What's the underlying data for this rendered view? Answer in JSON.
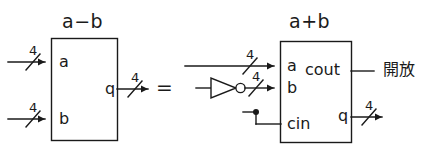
{
  "diagram": {
    "type": "digital-logic-circuit-equivalence",
    "background_color": "#ffffff",
    "ink_color": "#1a1a1a",
    "equality_symbol": "=",
    "left_circuit": {
      "title": "a−b",
      "block_label": "a−b",
      "inputs": [
        {
          "name": "a",
          "label": "a",
          "bus_width": "4"
        },
        {
          "name": "b",
          "label": "b",
          "bus_width": "4"
        }
      ],
      "outputs": [
        {
          "name": "q",
          "label": "q",
          "bus_width": "4"
        }
      ]
    },
    "right_circuit": {
      "title": "a+b",
      "block_label": "a+b",
      "inputs": [
        {
          "name": "a",
          "label": "a",
          "bus_width": "4"
        },
        {
          "name": "b",
          "label": "b",
          "bus_width": "4"
        },
        {
          "name": "cin",
          "label": "cin",
          "bus_width": ""
        }
      ],
      "outputs": [
        {
          "name": "cout",
          "label": "cout",
          "bus_width": "",
          "annotation": "開放"
        },
        {
          "name": "q",
          "label": "q",
          "bus_width": "4"
        }
      ],
      "gates": [
        {
          "name": "inverter",
          "symbol": "NOT",
          "label": ""
        }
      ],
      "cout_note": "開放"
    }
  }
}
